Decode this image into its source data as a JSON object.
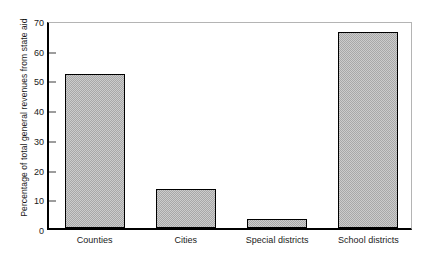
{
  "chart_data": {
    "type": "bar",
    "title": "",
    "subtitle": "",
    "xlabel": "",
    "ylabel": "Percentage of total general revenues from state aid",
    "categories": [
      "Counties",
      "Cities",
      "Special districts",
      "School districts"
    ],
    "values": [
      52,
      13,
      3,
      66
    ],
    "ylim": [
      0,
      70
    ],
    "yticks": [
      0,
      10,
      20,
      30,
      40,
      50,
      60,
      70
    ],
    "ytick_labels": [
      "0",
      "10",
      "20",
      "30",
      "40",
      "50",
      "60",
      "70"
    ],
    "grid": false,
    "legend": null,
    "annotations": [],
    "series": [
      {
        "name": "Percentage of total general revenues from state aid",
        "values": [
          52,
          13,
          3,
          66
        ]
      }
    ],
    "style": {
      "bar_fill": "#a8a8a8",
      "bar_fill_pattern": "checkerboard-dither",
      "bar_edge": "#000000",
      "axis_color": "#000000",
      "frame_color": "#b4b4b4",
      "text_color": "#1a1a1a",
      "background": "#ffffff"
    }
  }
}
